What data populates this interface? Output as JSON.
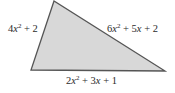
{
  "diagram": {
    "shape": "triangle",
    "fill_color": "#d8d8d8",
    "stroke_color": "#555555",
    "vertices": [
      [
        54,
        1
      ],
      [
        31,
        70
      ],
      [
        165,
        71
      ]
    ],
    "sides": {
      "left": {
        "coef1": "4",
        "var": "x",
        "exp": "2",
        "rest": "+ 2"
      },
      "right": {
        "coef1": "6",
        "var": "x",
        "exp": "2",
        "rest1": "+ 5",
        "var2": "x",
        "rest2": "+ 2"
      },
      "bottom": {
        "coef1": "2",
        "var": "x",
        "exp": "2",
        "rest1": "+ 3",
        "var2": "x",
        "rest2": "+ 1"
      }
    },
    "side_labels_text": {
      "left": "4x^2 + 2",
      "right": "6x^2 + 5x + 2",
      "bottom": "2x^2 + 3x + 1"
    }
  }
}
